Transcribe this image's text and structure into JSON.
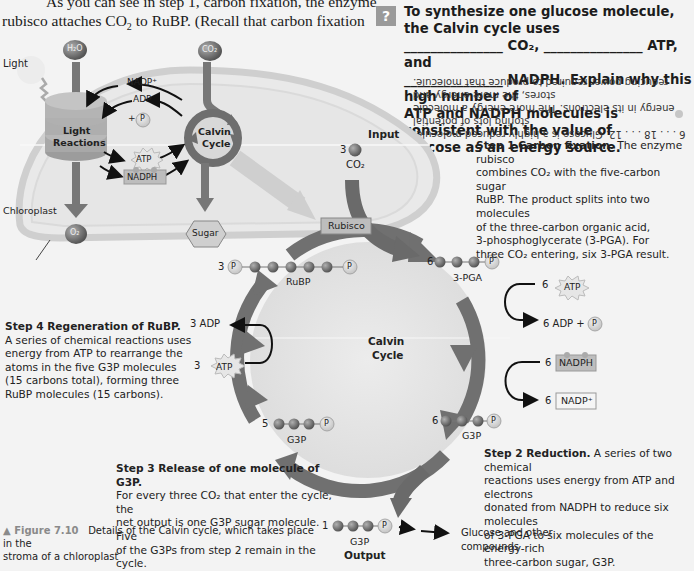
{
  "body_text": {
    "line1": "As you can see in step 1, carbon fixation, the enzyme",
    "line2_pre": "rubisco attaches CO",
    "line2_sub": "2",
    "line2_post": " to RuBP. (Recall that carbon fixation"
  },
  "question": {
    "badge": "?",
    "line1": "To synthesize one glucose molecule, the Calvin cycle uses",
    "line2": "_______________ CO₂, _______________ ATP, and",
    "line3": "_______________ NADPH. Explain why this high number of",
    "line4": "ATP and NADPH molecules is consistent with the value of",
    "line5": "glucose as an energy source.",
    "answer_bullet": "●",
    "answer_line1": "6 . . . 18 . . . 12. Glucose is a highly reduced molecule, storing lots of potential",
    "answer_line2": "energy in its electrons. The more energy a molecule stores, the more energy and",
    "answer_line3": "reducing power required to produce that molecule."
  },
  "overview": {
    "h2o": "H₂O",
    "co2": "CO₂",
    "light": "Light",
    "nadp_plus": "NADP⁺",
    "adp": "ADP",
    "plus_p": "+",
    "p": "P",
    "light_reactions_1": "Light",
    "light_reactions_2": "Reactions",
    "calvin_1": "Calvin",
    "calvin_2": "Cycle",
    "atp": "ATP",
    "nadph": "NADPH",
    "chloroplast": "Chloroplast",
    "o2": "O₂",
    "sugar": "Sugar"
  },
  "cycle": {
    "input_label": "Input",
    "input_count": "3",
    "input_co2": "CO₂",
    "rubisco": "Rubisco",
    "rubp_count": "3",
    "rubp_label": "RuBP",
    "pga_count": "6",
    "pga_label": "3-PGA",
    "center_1": "Calvin",
    "center_2": "Cycle",
    "atp_in_count": "6",
    "atp_in": "ATP",
    "adp_out": "6 ADP +",
    "nadph_count": "6",
    "nadph": "NADPH",
    "nadp_count": "6",
    "nadp": "NADP⁺",
    "g3p6_count": "6",
    "g3p6_label": "G3P",
    "g3p5_count": "5",
    "g3p5_label": "G3P",
    "regen_adp": "3 ADP",
    "regen_atp_count": "3",
    "regen_atp": "ATP",
    "output_count": "1",
    "output_g3p": "G3P",
    "output_label": "Output",
    "glucose_1": "Glucose and other",
    "glucose_2": "compounds",
    "p": "P"
  },
  "steps": {
    "step1_title": "Step 1 Carbon fixation.",
    "step1_lines": [
      " The enzyme rubisco",
      "combines CO₂ with the five-carbon sugar",
      "RuBP. The product splits into two molecules",
      "of the three-carbon organic acid,",
      "3-phosphoglycerate (3-PGA). For",
      "three CO₂ entering, six 3-PGA result."
    ],
    "step2_title": "Step 2 Reduction.",
    "step2_lines": [
      " A series of two chemical",
      "reactions uses energy from ATP and electrons",
      "donated from NADPH to reduce six molecules",
      "of 3-PGA to six molecules of the energy-rich",
      "three-carbon sugar, G3P."
    ],
    "step3_title": "Step 3 Release of one molecule of G3P.",
    "step3_lines": [
      "For every three CO₂ that enter the cycle, the",
      "net output is one G3P sugar molecule. Five",
      "of the G3Ps from step 2 remain in the cycle."
    ],
    "step4_title": "Step 4 Regeneration of RuBP.",
    "step4_lines": [
      "A series of chemical reactions uses",
      "energy from ATP to rearrange the",
      "atoms in the five G3P molecules",
      "(15 carbons total), forming three",
      "RuBP molecules (15 carbons)."
    ]
  },
  "caption": {
    "marker": "▲ Figure 7.10",
    "text1": "Details of the Calvin cycle, which takes place in the",
    "text2": "stroma of a chloroplast"
  },
  "colors": {
    "background": "#f3f3f3",
    "arrow_gray": "#6f6f6f",
    "molecule_dark": "#6a6a6a",
    "phosphate_light": "#d6d6d6"
  }
}
